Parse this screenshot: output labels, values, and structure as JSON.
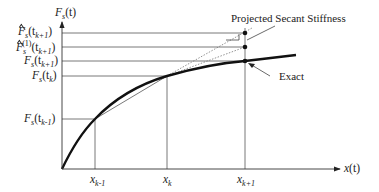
{
  "diagram": {
    "type": "secant-stiffness-projection",
    "y_axis_label": {
      "main": "F",
      "sub": "s",
      "arg": "(t)"
    },
    "x_axis_label": {
      "main": "x",
      "arg": "(t)"
    },
    "y_ticks": [
      {
        "id": "fhat",
        "text_main": "F",
        "text_sub": "s",
        "text_arg": "(t",
        "text_arg_sub": "k+1",
        "close": ")",
        "hat": true,
        "superscript": ""
      },
      {
        "id": "fhat1",
        "text_main": "F",
        "text_sub": "s",
        "text_arg": "(t",
        "text_arg_sub": "k+1",
        "close": ")",
        "hat": true,
        "superscript": "(1)"
      },
      {
        "id": "fk1",
        "text_main": "F",
        "text_sub": "s",
        "text_arg": "(t",
        "text_arg_sub": "k+1",
        "close": ")",
        "hat": false,
        "superscript": ""
      },
      {
        "id": "fk",
        "text_main": "F",
        "text_sub": "s",
        "text_arg": "(t",
        "text_arg_sub": "k",
        "close": ")",
        "hat": false,
        "superscript": ""
      },
      {
        "id": "fkm1",
        "text_main": "F",
        "text_sub": "s",
        "text_arg": "(t",
        "text_arg_sub": "k-1",
        "close": ")",
        "hat": false,
        "superscript": ""
      }
    ],
    "x_ticks": [
      {
        "id": "xkm1",
        "main": "x",
        "sub": "k-1"
      },
      {
        "id": "xk",
        "main": "x",
        "sub": "k"
      },
      {
        "id": "xkp1",
        "main": "x",
        "sub": "k+1"
      }
    ],
    "annotations": {
      "projected": "Projected Secant Stiffness",
      "exact": "Exact"
    },
    "colors": {
      "curve": "#111111",
      "grid": "#555555",
      "dotted": "#777777"
    }
  }
}
